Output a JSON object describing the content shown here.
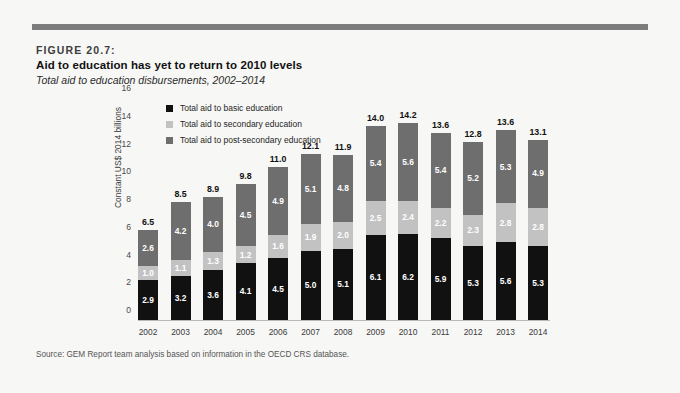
{
  "figure": {
    "number_label": "FIGURE 20.7:",
    "title": "Aid to education has yet to return to 2010 levels",
    "subtitle": "Total aid to education disbursements, 2002–2014",
    "source": "Source: GEM Report team analysis based on information in the OECD CRS database."
  },
  "colors": {
    "basic": "#111111",
    "secondary": "#c2c2c2",
    "post_secondary": "#6e6e6e",
    "rule": "#7c7c7c",
    "background": "#f7f7f5"
  },
  "chart_data": {
    "type": "bar",
    "stacked": true,
    "title": "Aid to education has yet to return to 2010 levels",
    "subtitle": "Total aid to education disbursements, 2002–2014",
    "xlabel": "",
    "ylabel": "Constant US$ 2014 billions",
    "ylim": [
      0,
      16
    ],
    "yticks": [
      0,
      2,
      4,
      6,
      8,
      10,
      12,
      14,
      16
    ],
    "grid": false,
    "legend_position": "top-left",
    "categories": [
      "2002",
      "2003",
      "2004",
      "2005",
      "2006",
      "2007",
      "2008",
      "2009",
      "2010",
      "2011",
      "2012",
      "2013",
      "2014"
    ],
    "series": [
      {
        "name": "Total aid to basic education",
        "key": "basic",
        "color": "#111111",
        "values": [
          2.9,
          3.2,
          3.6,
          4.1,
          4.5,
          5.0,
          5.1,
          6.1,
          6.2,
          5.9,
          5.3,
          5.6,
          5.3
        ]
      },
      {
        "name": "Total aid to secondary education",
        "key": "secondary",
        "color": "#c2c2c2",
        "values": [
          1.0,
          1.1,
          1.3,
          1.2,
          1.6,
          1.9,
          2.0,
          2.5,
          2.4,
          2.2,
          2.3,
          2.8,
          2.8
        ]
      },
      {
        "name": "Total aid to post-secondary education",
        "key": "post_secondary",
        "color": "#6e6e6e",
        "values": [
          2.6,
          4.2,
          4.0,
          4.5,
          4.9,
          5.1,
          4.8,
          5.4,
          5.6,
          5.4,
          5.2,
          5.3,
          4.9
        ]
      }
    ],
    "totals": [
      6.5,
      8.5,
      8.9,
      9.8,
      11.0,
      12.1,
      11.9,
      14.0,
      14.2,
      13.6,
      12.8,
      13.6,
      13.1
    ]
  }
}
